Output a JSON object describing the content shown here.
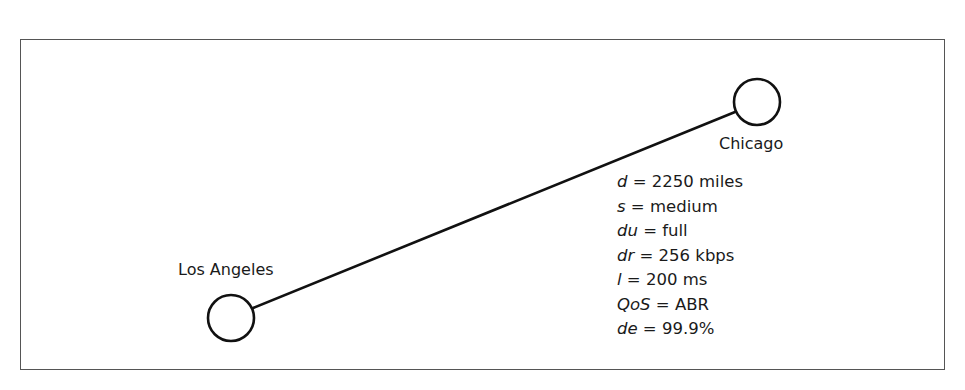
{
  "diagram": {
    "type": "network-link",
    "frame": {
      "border_color": "#555555"
    },
    "nodes": [
      {
        "id": "la",
        "label": "Los Angeles",
        "cx": 231,
        "cy": 318,
        "r": 23
      },
      {
        "id": "chi",
        "label": "Chicago",
        "cx": 757,
        "cy": 102,
        "r": 23
      }
    ],
    "link": {
      "from": "Los Angeles",
      "to": "Chicago",
      "attributes": [
        {
          "key": "d",
          "value": "2250 miles"
        },
        {
          "key": "s",
          "value": "medium"
        },
        {
          "key": "du",
          "value": "full"
        },
        {
          "key": "dr",
          "value": "256 kbps"
        },
        {
          "key": "l",
          "value": "200 ms"
        },
        {
          "key": "QoS",
          "value": "ABR"
        },
        {
          "key": "de",
          "value": "99.9%"
        }
      ]
    },
    "stroke_color": "#111111"
  }
}
